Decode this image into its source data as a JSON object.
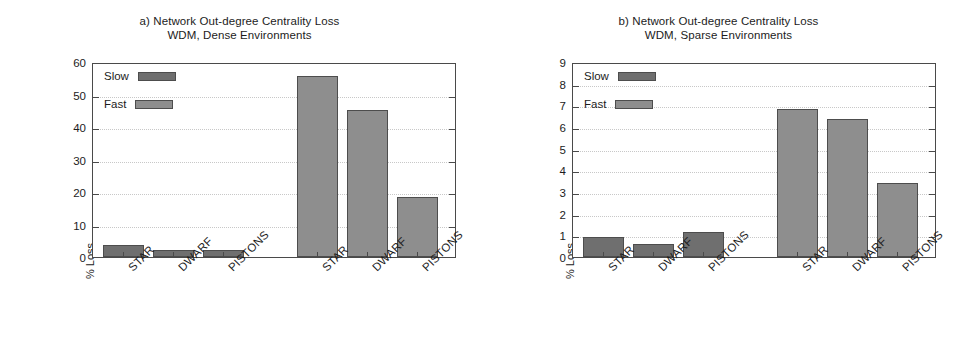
{
  "figure": {
    "width": 958,
    "height": 345,
    "background": "#ffffff"
  },
  "colors": {
    "slow": "#6f6f6f",
    "fast": "#8e8e8e",
    "axis": "#4a4a4a",
    "grid": "#c8c8c8",
    "text": "#1c1c1c"
  },
  "chart_data": [
    {
      "type": "bar",
      "panel_id": "a",
      "title": "a) Network Out-degree Centrality Loss",
      "subtitle": "WDM, Dense Environments",
      "xlabel": "",
      "ylabel": "% Loss",
      "ylim": [
        0,
        60
      ],
      "yticks": [
        0,
        10,
        20,
        30,
        40,
        50,
        60
      ],
      "ytick_labels": [
        "0",
        "10",
        "20",
        "30",
        "40",
        "50",
        "60"
      ],
      "grid": true,
      "legend": [
        "Slow",
        "Fast"
      ],
      "legend_position": "upper left",
      "categories": [
        "STAR",
        "DWARF",
        "PISTONS"
      ],
      "group_order": [
        "Slow",
        "Fast"
      ],
      "series": [
        {
          "name": "Slow",
          "color": "#6f6f6f",
          "values": [
            3.8,
            2.1,
            2.3
          ]
        },
        {
          "name": "Fast",
          "color": "#8e8e8e",
          "values": [
            55.8,
            45.3,
            18.4
          ]
        }
      ]
    },
    {
      "type": "bar",
      "panel_id": "b",
      "title": "b) Network Out-degree Centrality Loss",
      "subtitle": "WDM, Sparse Environments",
      "xlabel": "",
      "ylabel": "% Loss",
      "ylim": [
        0,
        9
      ],
      "yticks": [
        0,
        1,
        2,
        3,
        4,
        5,
        6,
        7,
        8,
        9
      ],
      "ytick_labels": [
        "0",
        "1",
        "2",
        "3",
        "4",
        "5",
        "6",
        "7",
        "8",
        "9"
      ],
      "grid": true,
      "legend": [
        "Slow",
        "Fast"
      ],
      "legend_position": "upper left",
      "categories": [
        "STAR",
        "DWARF",
        "PISTONS"
      ],
      "group_order": [
        "Slow",
        "Fast"
      ],
      "series": [
        {
          "name": "Slow",
          "color": "#6f6f6f",
          "values": [
            0.92,
            0.6,
            1.15
          ]
        },
        {
          "name": "Fast",
          "color": "#8e8e8e",
          "values": [
            6.85,
            6.35,
            3.4
          ]
        }
      ]
    }
  ],
  "panels": [
    {
      "title_line1": "a) Network Out-degree Centrality Loss",
      "title_line2": "WDM, Dense Environments",
      "ylabel": "% Loss",
      "ytick_labels": [
        "60",
        "50",
        "40",
        "30",
        "20",
        "10",
        "0"
      ],
      "xtick_labels": [
        "STAR",
        "DWARF",
        "PISTONS",
        "STAR",
        "DWARF",
        "PISTONS"
      ],
      "legend": {
        "slow": "Slow",
        "fast": "Fast"
      }
    },
    {
      "title_line1": "b) Network Out-degree Centrality Loss",
      "title_line2": "WDM, Sparse Environments",
      "ylabel": "% Loss",
      "ytick_labels": [
        "9",
        "8",
        "7",
        "6",
        "5",
        "4",
        "3",
        "2",
        "1",
        "0"
      ],
      "xtick_labels": [
        "STAR",
        "DWARF",
        "PISTONS",
        "STAR",
        "DWARF",
        "PISTONS"
      ],
      "legend": {
        "slow": "Slow",
        "fast": "Fast"
      }
    }
  ]
}
